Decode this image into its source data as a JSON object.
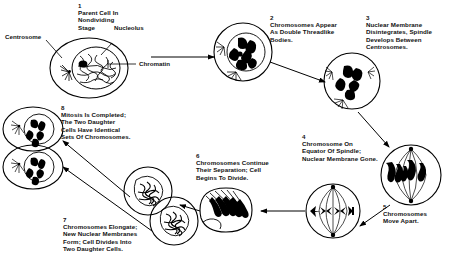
{
  "diagram": {
    "type": "cycle-diagram",
    "stages": [
      {
        "number": "1",
        "caption": "Parent Cell In\nNondividing\nStage",
        "cell_name": "parent-cell-interphase"
      },
      {
        "number": "2",
        "caption": "Chromosomes Appear\nAs Double Threadlike\nBodies.",
        "cell_name": "cell-prophase-early"
      },
      {
        "number": "3",
        "caption": "Nuclear Membrane\nDisintegrates, Spindle\nDevelops Between\nCentrosomes.",
        "cell_name": "cell-prophase-late"
      },
      {
        "number": "4",
        "caption": "Chromosome On\nEquator Of Spindle;\nNuclear Membrane Gone.",
        "cell_name": "cell-metaphase"
      },
      {
        "number": "5",
        "caption": "Chromosomes\nMove Apart.",
        "cell_name": "cell-anaphase"
      },
      {
        "number": "6",
        "caption": "Chromosomes Continue\nTheir Separation; Cell\nBegins To Divide.",
        "cell_name": "cell-telophase"
      },
      {
        "number": "7",
        "caption": "Chromosomes Elongate;\nNew Nuclear Membranes\nForm; Cell Divides Into\nTwo Daughter Cells.",
        "cell_name": "cell-cytokinesis"
      },
      {
        "number": "8",
        "caption": "Mitosis Is Completed;\nThe Two Daughter\nCells Have Identical\nSets Of Chromosomes.",
        "cell_name": "daughter-cells"
      }
    ],
    "callouts": [
      {
        "label": "Centrosome",
        "target": "centrosome"
      },
      {
        "label": "Nucleolus",
        "target": "nucleolus"
      },
      {
        "label": "Chromatin",
        "target": "chromatin"
      }
    ],
    "colors": {
      "ink": "#000000",
      "background": "#ffffff"
    }
  }
}
